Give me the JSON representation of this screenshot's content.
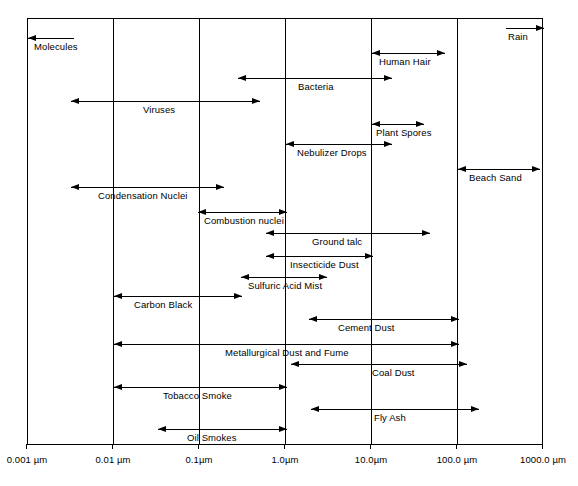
{
  "chart_data": {
    "type": "bar",
    "orientation": "horizontal-range",
    "title": "",
    "xlabel": "",
    "ylabel": "",
    "scale": "log",
    "grid": true,
    "legend": null,
    "xlim": [
      0.001,
      1000.0
    ],
    "categories": [
      "Molecules",
      "Rain",
      "Bacteria",
      "Human Hair",
      "Viruses",
      "Plant Spores",
      "Nebulizer Drops",
      "Beach Sand",
      "Condensation Nuclei",
      "Combustion nuclei",
      "Ground talc",
      "Insecticide Dust",
      "Sulfuric Acid Mist",
      "Carbon Black",
      "Cement Dust",
      "Metallurgical Dust and Fume",
      "Coal Dust",
      "Tobacco Smoke",
      "Fly Ash",
      "Oil Smokes"
    ],
    "tick_labels": [
      "0.001 µm",
      "0.01 µm",
      "0.1µm",
      "1.0µm",
      "10.0µm",
      "100.0 µm",
      "1000.0 µm"
    ],
    "tick_values": [
      0.001,
      0.01,
      0.1,
      1.0,
      10.0,
      100.0,
      1000.0
    ],
    "series": [
      {
        "name": "Molecules",
        "x_start": 0.0032,
        "x_end": 0.001,
        "arrow_start": false,
        "arrow_end": true,
        "row": 0,
        "label_x": 33,
        "line_x1": 27,
        "line_x2": 73,
        "arrow_left": true,
        "arrow_right": false
      },
      {
        "name": "Rain",
        "x_start": 320,
        "x_end": 1000,
        "arrow_start": false,
        "arrow_end": true,
        "row": 0,
        "label_x": 507,
        "line_x1": 505,
        "line_x2": 543,
        "arrow_left": false,
        "arrow_right": true
      },
      {
        "name": "Human Hair",
        "x_start": 10,
        "x_end": 65,
        "arrow_start": true,
        "arrow_end": true,
        "row": 1,
        "label_x": 378,
        "line_x1": 371,
        "line_x2": 444,
        "arrow_left": true,
        "arrow_right": true
      },
      {
        "name": "Bacteria",
        "x_start": 0.35,
        "x_end": 16,
        "arrow_start": true,
        "arrow_end": true,
        "row": 2,
        "label_x": 297,
        "line_x1": 237,
        "line_x2": 391,
        "arrow_left": true,
        "arrow_right": true
      },
      {
        "name": "Viruses",
        "x_start": 0.0029,
        "x_end": 0.55,
        "arrow_start": true,
        "arrow_end": true,
        "row": 3,
        "label_x": 142,
        "line_x1": 70,
        "line_x2": 259,
        "arrow_left": true,
        "arrow_right": true
      },
      {
        "name": "Plant Spores",
        "x_start": 10,
        "x_end": 37,
        "arrow_start": true,
        "arrow_end": true,
        "row": 4,
        "label_x": 375,
        "line_x1": 371,
        "line_x2": 423,
        "arrow_left": true,
        "arrow_right": true
      },
      {
        "name": "Nebulizer Drops",
        "x_start": 1.0,
        "x_end": 16,
        "arrow_start": true,
        "arrow_end": true,
        "row": 5,
        "label_x": 296,
        "line_x1": 285,
        "line_x2": 391,
        "arrow_left": true,
        "arrow_right": true
      },
      {
        "name": "Beach Sand",
        "x_start": 100,
        "x_end": 800,
        "arrow_start": true,
        "arrow_end": true,
        "row": 6,
        "label_x": 468,
        "line_x1": 457,
        "line_x2": 539,
        "arrow_left": true,
        "arrow_right": true
      },
      {
        "name": "Condensation Nuclei",
        "x_start": 0.0029,
        "x_end": 0.18,
        "arrow_start": true,
        "arrow_end": true,
        "row": 7,
        "label_x": 97,
        "line_x1": 70,
        "line_x2": 223,
        "arrow_left": true,
        "arrow_right": true
      },
      {
        "name": "Combustion nuclei",
        "x_start": 0.016,
        "x_end": 1.0,
        "arrow_start": true,
        "arrow_end": true,
        "row": 8,
        "label_x": 203,
        "line_x1": 197,
        "line_x2": 286,
        "arrow_left": true,
        "arrow_right": true
      },
      {
        "name": "Ground talc",
        "x_start": 0.6,
        "x_end": 43,
        "arrow_start": true,
        "arrow_end": true,
        "row": 9,
        "label_x": 311,
        "line_x1": 265,
        "line_x2": 429,
        "arrow_left": true,
        "arrow_right": true
      },
      {
        "name": "Insecticide Dust",
        "x_start": 0.6,
        "x_end": 10,
        "arrow_start": true,
        "arrow_end": true,
        "row": 10,
        "label_x": 289,
        "line_x1": 265,
        "line_x2": 372,
        "arrow_left": true,
        "arrow_right": true
      },
      {
        "name": "Sulfuric Acid Mist",
        "x_start": 0.32,
        "x_end": 3.0,
        "arrow_start": true,
        "arrow_end": true,
        "row": 11,
        "label_x": 247,
        "line_x1": 240,
        "line_x2": 326,
        "arrow_left": true,
        "arrow_right": true
      },
      {
        "name": "Carbon Black",
        "x_start": 0.01,
        "x_end": 0.29,
        "arrow_start": true,
        "arrow_end": true,
        "row": 12,
        "label_x": 133,
        "line_x1": 113,
        "line_x2": 241,
        "arrow_left": true,
        "arrow_right": true
      },
      {
        "name": "Cement Dust",
        "x_start": 1.8,
        "x_end": 100,
        "arrow_start": true,
        "arrow_end": true,
        "row": 13,
        "label_x": 337,
        "line_x1": 308,
        "line_x2": 458,
        "arrow_left": true,
        "arrow_right": true
      },
      {
        "name": "Metallurgical Dust and Fume",
        "x_start": 0.01,
        "x_end": 100,
        "arrow_start": true,
        "arrow_end": true,
        "row": 14,
        "label_x": 224,
        "line_x1": 113,
        "line_x2": 458,
        "arrow_left": true,
        "arrow_right": true
      },
      {
        "name": "Coal Dust",
        "x_start": 1.15,
        "x_end": 130,
        "arrow_start": true,
        "arrow_end": true,
        "row": 15,
        "label_x": 371,
        "line_x1": 290,
        "line_x2": 466,
        "arrow_left": true,
        "arrow_right": true
      },
      {
        "name": "Tobacco Smoke",
        "x_start": 0.01,
        "x_end": 1.0,
        "arrow_start": true,
        "arrow_end": true,
        "row": 16,
        "label_x": 162,
        "line_x1": 113,
        "line_x2": 286,
        "arrow_left": true,
        "arrow_right": true
      },
      {
        "name": "Fly Ash",
        "x_start": 1.7,
        "x_end": 230,
        "arrow_start": true,
        "arrow_end": true,
        "row": 17,
        "label_x": 373,
        "line_x1": 310,
        "line_x2": 478,
        "arrow_left": true,
        "arrow_right": true
      },
      {
        "name": "Oil Smokes",
        "x_start": 0.03,
        "x_end": 1.0,
        "arrow_start": true,
        "arrow_end": true,
        "row": 18,
        "label_x": 186,
        "line_x1": 157,
        "line_x2": 286,
        "arrow_left": true,
        "arrow_right": true
      }
    ]
  },
  "axis": {
    "ticks": [
      {
        "label": "0.001  µm",
        "x": 27
      },
      {
        "label": "0.01 µm",
        "x": 113
      },
      {
        "label": "0.1µm",
        "x": 199
      },
      {
        "label": "1.0µm",
        "x": 285
      },
      {
        "label": "10.0µm",
        "x": 371
      },
      {
        "label": "100.0 µm",
        "x": 457
      },
      {
        "label": "1000.0 µm",
        "x": 543
      }
    ]
  },
  "bands": [
    {
      "label": "Molecules",
      "top": 37,
      "line_x1": 27,
      "line_x2": 73,
      "left_arrow": true,
      "right_arrow": false,
      "label_x": 33
    },
    {
      "label": "Rain",
      "top": 27,
      "line_x1": 505,
      "line_x2": 543,
      "left_arrow": false,
      "right_arrow": true,
      "label_x": 507
    },
    {
      "label": "Human Hair",
      "top": 52,
      "line_x1": 371,
      "line_x2": 444,
      "left_arrow": true,
      "right_arrow": true,
      "label_x": 378
    },
    {
      "label": "Bacteria",
      "top": 77,
      "line_x1": 237,
      "line_x2": 391,
      "left_arrow": true,
      "right_arrow": true,
      "label_x": 297
    },
    {
      "label": "Viruses",
      "top": 100,
      "line_x1": 70,
      "line_x2": 259,
      "left_arrow": true,
      "right_arrow": true,
      "label_x": 142
    },
    {
      "label": "Plant Spores",
      "top": 123,
      "line_x1": 371,
      "line_x2": 423,
      "left_arrow": true,
      "right_arrow": true,
      "label_x": 375
    },
    {
      "label": "Nebulizer Drops",
      "top": 143,
      "line_x1": 285,
      "line_x2": 391,
      "left_arrow": true,
      "right_arrow": true,
      "label_x": 296
    },
    {
      "label": "Beach Sand",
      "top": 168,
      "line_x1": 457,
      "line_x2": 539,
      "left_arrow": true,
      "right_arrow": true,
      "label_x": 468
    },
    {
      "label": "Condensation Nuclei",
      "top": 186,
      "line_x1": 70,
      "line_x2": 223,
      "left_arrow": true,
      "right_arrow": true,
      "label_x": 97
    },
    {
      "label": "Combustion nuclei",
      "top": 211,
      "line_x1": 197,
      "line_x2": 286,
      "left_arrow": true,
      "right_arrow": true,
      "label_x": 203
    },
    {
      "label": "Ground talc",
      "top": 232,
      "line_x1": 265,
      "line_x2": 429,
      "left_arrow": true,
      "right_arrow": true,
      "label_x": 311
    },
    {
      "label": "Insecticide Dust",
      "top": 255,
      "line_x1": 265,
      "line_x2": 372,
      "left_arrow": true,
      "right_arrow": true,
      "label_x": 289
    },
    {
      "label": "Sulfuric Acid Mist",
      "top": 276,
      "line_x1": 240,
      "line_x2": 326,
      "left_arrow": true,
      "right_arrow": true,
      "label_x": 247
    },
    {
      "label": "Carbon Black",
      "top": 295,
      "line_x1": 113,
      "line_x2": 241,
      "left_arrow": true,
      "right_arrow": true,
      "label_x": 133
    },
    {
      "label": "Cement Dust",
      "top": 318,
      "line_x1": 308,
      "line_x2": 458,
      "left_arrow": true,
      "right_arrow": true,
      "label_x": 337
    },
    {
      "label": "Metallurgical Dust and Fume",
      "top": 343,
      "line_x1": 113,
      "line_x2": 458,
      "left_arrow": true,
      "right_arrow": true,
      "label_x": 224
    },
    {
      "label": "Coal Dust",
      "top": 363,
      "line_x1": 290,
      "line_x2": 466,
      "left_arrow": true,
      "right_arrow": true,
      "label_x": 371
    },
    {
      "label": "Tobacco Smoke",
      "top": 386,
      "line_x1": 113,
      "line_x2": 286,
      "left_arrow": true,
      "right_arrow": true,
      "label_x": 162
    },
    {
      "label": "Fly Ash",
      "top": 408,
      "line_x1": 310,
      "line_x2": 478,
      "left_arrow": true,
      "right_arrow": true,
      "label_x": 373
    },
    {
      "label": "Oil Smokes",
      "top": 428,
      "line_x1": 157,
      "line_x2": 286,
      "left_arrow": true,
      "right_arrow": true,
      "label_x": 186
    }
  ],
  "caption": ""
}
